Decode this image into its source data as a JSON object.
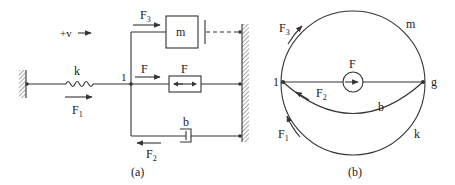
{
  "panel_a": {
    "caption": "(a)",
    "velocity_label": "+v",
    "node_label": "1",
    "spring": {
      "label": "k",
      "force": "F",
      "force_sub": "1"
    },
    "mass": {
      "label": "m",
      "force": "F",
      "force_sub": "3"
    },
    "source": {
      "label": "F",
      "force": "F"
    },
    "damper": {
      "label": "b",
      "force": "F",
      "force_sub": "2"
    }
  },
  "panel_b": {
    "caption": "(b)",
    "node_left": "1",
    "node_right": "g",
    "source_label": "F",
    "edges": {
      "top": "m",
      "middle": "b",
      "bottom": "k"
    },
    "forces": {
      "f3": {
        "base": "F",
        "sub": "3"
      },
      "f2": {
        "base": "F",
        "sub": "2"
      },
      "f1": {
        "base": "F",
        "sub": "1"
      }
    }
  },
  "colors": {
    "line": "#333333",
    "text": "#222222",
    "background": "#ffffff"
  }
}
